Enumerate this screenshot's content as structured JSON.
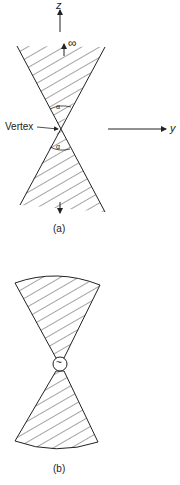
{
  "figure_a": {
    "axis_z_label": "z",
    "axis_y_label": "y",
    "infinity_label": "∞",
    "vertex_label": "Vertex",
    "angle_label_top": "α",
    "angle_label_bottom": "α",
    "caption": "(a)"
  },
  "figure_b": {
    "source_symbol": "~",
    "caption": "(b)"
  },
  "colors": {
    "ink": "#222222",
    "background": "#ffffff"
  }
}
